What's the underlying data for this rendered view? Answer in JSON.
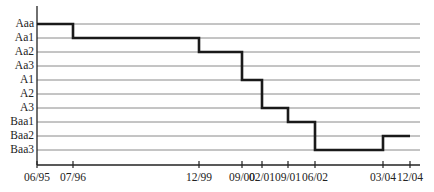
{
  "chart_data": {
    "type": "line",
    "subtype": "step",
    "title": "",
    "xlabel": "",
    "ylabel": "",
    "y_categories": [
      "Aaa",
      "Aa1",
      "Aa2",
      "Aa3",
      "A1",
      "A2",
      "A3",
      "Baa1",
      "Baa2",
      "Baa3"
    ],
    "x_ticks": [
      "06/95",
      "07/96",
      "12/99",
      "09/00",
      "02/01",
      "09/01",
      "06/02",
      "03/04",
      "12/04"
    ],
    "series": [
      {
        "name": "Rating",
        "points": [
          {
            "x": "06/95",
            "y": "Aaa"
          },
          {
            "x": "07/96",
            "y": "Aa1"
          },
          {
            "x": "12/99",
            "y": "Aa2"
          },
          {
            "x": "09/00",
            "y": "A1"
          },
          {
            "x": "02/01",
            "y": "A3"
          },
          {
            "x": "09/01",
            "y": "Baa1"
          },
          {
            "x": "06/02",
            "y": "Baa3"
          },
          {
            "x": "03/04",
            "y": "Baa2"
          },
          {
            "x": "12/04",
            "y": "Baa2"
          }
        ]
      }
    ],
    "grid": true,
    "legend": "none"
  },
  "layout": {
    "y_positions": [
      24,
      38,
      52,
      66,
      80,
      94,
      108,
      122,
      136,
      150
    ],
    "x_positions": [
      37,
      73,
      199,
      242,
      262,
      288,
      315,
      383,
      410
    ],
    "axis_y": 165,
    "grid_right": 420,
    "colors": {
      "line": "#1a1a1a",
      "grid": "#8a8a8a",
      "axis": "#222222"
    }
  }
}
